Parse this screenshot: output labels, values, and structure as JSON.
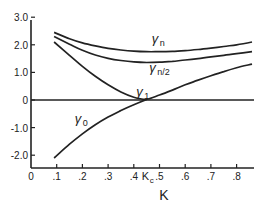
{
  "chart_data": {
    "type": "line",
    "title": "",
    "xlabel": "K",
    "ylabel": "",
    "xlim": [
      0,
      0.86
    ],
    "ylim": [
      -2.5,
      3.0
    ],
    "grid": false,
    "x_ticks": [
      {
        "value": 0,
        "label": "0"
      },
      {
        "value": 0.1,
        "label": ".1"
      },
      {
        "value": 0.2,
        "label": ".2"
      },
      {
        "value": 0.3,
        "label": ".3"
      },
      {
        "value": 0.4,
        "label": ".4"
      },
      {
        "value": 0.45,
        "label": "Kc",
        "special": true
      },
      {
        "value": 0.5,
        "label": ".5"
      },
      {
        "value": 0.6,
        "label": ".6"
      },
      {
        "value": 0.7,
        "label": ".7"
      },
      {
        "value": 0.8,
        "label": ".8"
      }
    ],
    "y_ticks": [
      {
        "value": 3.0,
        "label": "3.0"
      },
      {
        "value": 2.0,
        "label": "2.0"
      },
      {
        "value": 1.0,
        "label": "1.0"
      },
      {
        "value": 0,
        "label": "0"
      },
      {
        "value": -1.0,
        "label": "-1.0"
      },
      {
        "value": -2.0,
        "label": "-2.0"
      }
    ],
    "reference_lines": [
      {
        "axis": "y",
        "value": 0
      }
    ],
    "series": [
      {
        "name": "γn",
        "label_main": "γ",
        "label_sub": "n",
        "label_at": [
          0.47,
          2.05
        ],
        "x": [
          0.09,
          0.15,
          0.2,
          0.25,
          0.3,
          0.35,
          0.4,
          0.45,
          0.5,
          0.55,
          0.6,
          0.65,
          0.7,
          0.75,
          0.8,
          0.86
        ],
        "y": [
          2.45,
          2.22,
          2.07,
          1.96,
          1.87,
          1.81,
          1.77,
          1.75,
          1.75,
          1.76,
          1.79,
          1.83,
          1.88,
          1.94,
          2.0,
          2.1
        ]
      },
      {
        "name": "γn/2",
        "label_main": "γ",
        "label_sub": "n/2",
        "label_at": [
          0.46,
          1.0
        ],
        "x": [
          0.09,
          0.15,
          0.2,
          0.25,
          0.3,
          0.35,
          0.4,
          0.45,
          0.5,
          0.55,
          0.6,
          0.65,
          0.7,
          0.75,
          0.8,
          0.86
        ],
        "y": [
          2.3,
          2.02,
          1.8,
          1.63,
          1.51,
          1.43,
          1.38,
          1.36,
          1.37,
          1.4,
          1.45,
          1.5,
          1.56,
          1.62,
          1.68,
          1.75
        ]
      },
      {
        "name": "γ1",
        "label_main": "γ",
        "label_sub": "1",
        "label_at": [
          0.41,
          0.16
        ],
        "x": [
          0.09,
          0.15,
          0.2,
          0.25,
          0.3,
          0.35,
          0.4,
          0.45,
          0.5,
          0.55,
          0.6,
          0.65,
          0.7,
          0.75,
          0.8,
          0.86
        ],
        "y": [
          2.1,
          1.62,
          1.22,
          0.86,
          0.55,
          0.29,
          0.1,
          0.03,
          0.18,
          0.36,
          0.55,
          0.72,
          0.88,
          1.03,
          1.17,
          1.3
        ]
      },
      {
        "name": "γ0",
        "label_main": "γ",
        "label_sub": "0",
        "label_at": [
          0.17,
          -0.85
        ],
        "x": [
          0.09,
          0.15,
          0.2,
          0.25,
          0.3,
          0.35,
          0.4,
          0.45
        ],
        "y": [
          -2.1,
          -1.6,
          -1.23,
          -0.9,
          -0.62,
          -0.38,
          -0.17,
          0.02
        ]
      }
    ]
  }
}
